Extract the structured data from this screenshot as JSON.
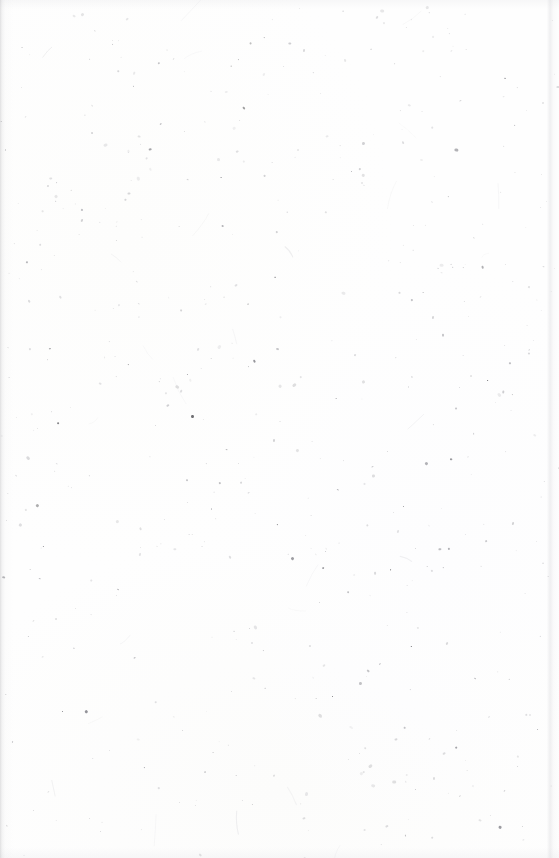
{
  "page": {
    "kind": "scanned-page",
    "content_state": "blank",
    "width": 559,
    "height": 858,
    "paper_color": "#fefefe",
    "background_base": "#ffffff",
    "visible_text": [],
    "notes_label": "This page is blank."
  },
  "artifacts": {
    "description": "scanner dust, paper fibers and toner speckles",
    "speckle_count": 520,
    "fiber_count": 26,
    "seed": 20240917,
    "speckle_palette": [
      "#d8d8da",
      "#c9c9cc",
      "#b6b6ba",
      "#a0a0a5",
      "#8a8a90",
      "#6e6e74",
      "#4e4e54",
      "#343438"
    ],
    "speckle_size_range_px": [
      0.6,
      2.9
    ],
    "fiber_color": "#dcdcdf",
    "fiber_length_range_px": [
      6,
      34
    ]
  },
  "edges": {
    "left_shadow_color": "#787a7d",
    "left_shadow_width_px": 13,
    "right_boundary_color": "#cdcdd2",
    "right_boundary_x_px": 550,
    "top_shade_px": 9,
    "bottom_shade_px": 11
  }
}
